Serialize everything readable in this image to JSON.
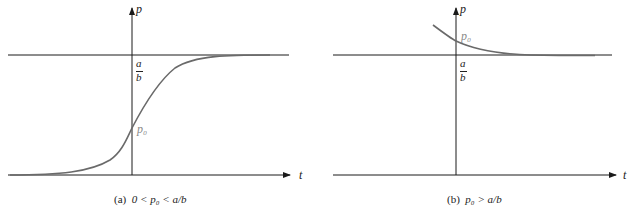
{
  "panels": [
    {
      "id": "a",
      "caption": "(a)  0 < p₀ < a/b",
      "caption_tag": "(a)",
      "caption_expr": "0 < p₀ < a/b",
      "axis_labels": {
        "x": "t",
        "y": "p"
      },
      "equilibrium_label_num": "a",
      "equilibrium_label_den": "b",
      "initial_label": "p₀",
      "curve": "logistic increasing from near 0 to a/b, passing p₀ at t=0"
    },
    {
      "id": "b",
      "caption": "(b)  p₀ > a/b",
      "caption_tag": "(b)",
      "caption_expr": "p₀ > a/b",
      "axis_labels": {
        "x": "t",
        "y": "p"
      },
      "equilibrium_label_num": "a",
      "equilibrium_label_den": "b",
      "initial_label": "p₀",
      "curve": "decreasing from above a/b, approaching a/b asymptotically"
    }
  ],
  "colors": {
    "axis": "#1a1a1a",
    "curve": "#6a6a6a",
    "p0_label": "#8a8a8a"
  }
}
